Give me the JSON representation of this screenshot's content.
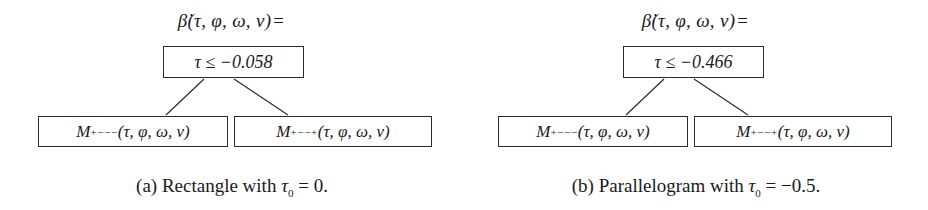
{
  "figure": {
    "type": "decision-tree-pair",
    "subfigures": [
      {
        "id": "a",
        "root_label": {
          "function": "β̇(τ, φ, ω, v)",
          "equals": "="
        },
        "condition_node": {
          "variable": "τ",
          "operator": "≤",
          "threshold": "−0.058",
          "text": "τ ≤ −0.058"
        },
        "left_leaf": {
          "symbol": "M",
          "superscript": "+−−−",
          "arguments": "(τ, φ, ω, v)",
          "text": "M+−−−(τ, φ, ω, v)"
        },
        "right_leaf": {
          "symbol": "M",
          "superscript": "+−−+",
          "arguments": "(τ, φ, ω, v)",
          "text": "M+−−+(τ, φ, ω, v)"
        },
        "caption": {
          "marker": "(a)",
          "text": "Rectangle with",
          "param": "τ",
          "param_sub": "0",
          "equals": "=",
          "value": "0."
        }
      },
      {
        "id": "b",
        "root_label": {
          "function": "β̇(τ, φ, ω, v)",
          "equals": "="
        },
        "condition_node": {
          "variable": "τ",
          "operator": "≤",
          "threshold": "−0.466",
          "text": "τ ≤ −0.466"
        },
        "left_leaf": {
          "symbol": "M",
          "superscript": "+−−−",
          "arguments": "(τ, φ, ω, v)",
          "text": "M+−−−(τ, φ, ω, v)"
        },
        "right_leaf": {
          "symbol": "M",
          "superscript": "+−−+",
          "arguments": "(τ, φ, ω, v)",
          "text": "M+−−+(τ, φ, ω, v)"
        },
        "caption": {
          "marker": "(b)",
          "text": "Parallelogram with",
          "param": "τ",
          "param_sub": "0",
          "equals": "=",
          "value": "−0.5."
        }
      }
    ],
    "colors": {
      "background": "#ffffff",
      "ink": "#1a1a1a",
      "box_border": "#2b2b2b"
    }
  }
}
